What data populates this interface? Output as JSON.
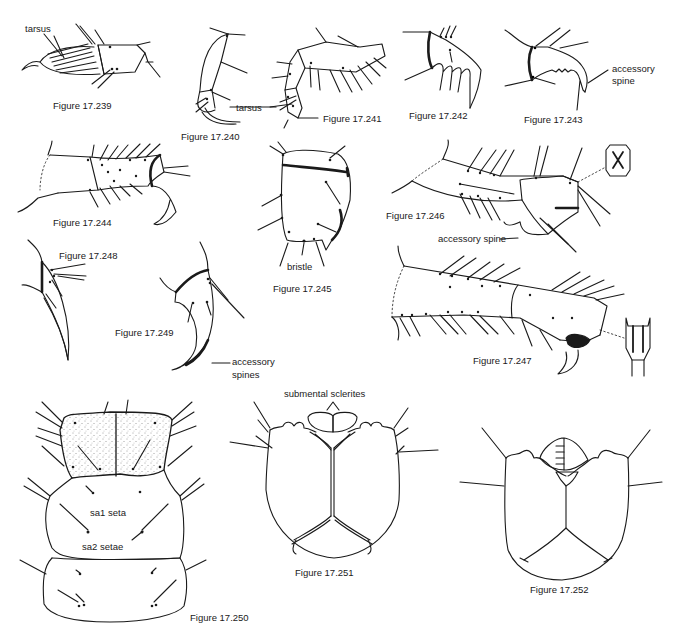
{
  "figures": [
    {
      "id": "17.239",
      "caption": "Figure 17.239",
      "labels": [
        "tarsus"
      ]
    },
    {
      "id": "17.240",
      "caption": "Figure 17.240",
      "labels": [
        "tarsus"
      ]
    },
    {
      "id": "17.241",
      "caption": "Figure 17.241",
      "labels": []
    },
    {
      "id": "17.242",
      "caption": "Figure 17.242",
      "labels": []
    },
    {
      "id": "17.243",
      "caption": "Figure 17.243",
      "labels": [
        "accessory",
        "spine"
      ]
    },
    {
      "id": "17.244",
      "caption": "Figure 17.244",
      "labels": []
    },
    {
      "id": "17.245",
      "caption": "Figure 17.245",
      "labels": [
        "bristle"
      ]
    },
    {
      "id": "17.246",
      "caption": "Figure 17.246",
      "labels": [
        "accessory spine"
      ]
    },
    {
      "id": "17.247",
      "caption": "Figure 17.247",
      "labels": []
    },
    {
      "id": "17.248",
      "caption": "Figure 17.248",
      "labels": []
    },
    {
      "id": "17.249",
      "caption": "Figure 17.249",
      "labels": [
        "accessory",
        "spines"
      ]
    },
    {
      "id": "17.250",
      "caption": "Figure 17.250",
      "labels": [
        "sa1 seta",
        "sa2 setae"
      ]
    },
    {
      "id": "17.251",
      "caption": "Figure 17.251",
      "labels": [
        "submental sclerites"
      ]
    },
    {
      "id": "17.252",
      "caption": "Figure 17.252",
      "labels": []
    }
  ]
}
